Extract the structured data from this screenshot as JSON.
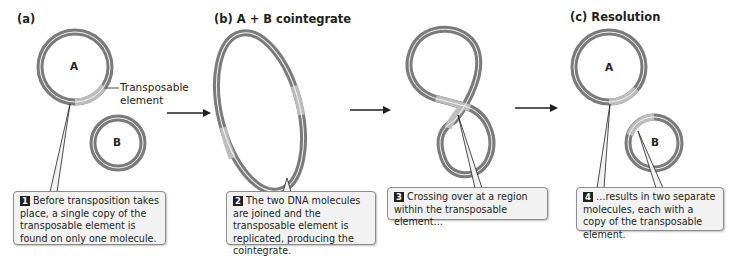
{
  "panels": {
    "a": {
      "label": "(a)"
    },
    "b": {
      "label": "(b)  A + B cointegrate"
    },
    "c": {
      "label": "(c)  Resolution"
    }
  },
  "molecules": {
    "a_A": "A",
    "a_B": "B",
    "c_A": "A",
    "c_B": "B"
  },
  "labels": {
    "transposable_element_line1": "Transposable",
    "transposable_element_line2": "element"
  },
  "steps": [
    {
      "number": "1",
      "text": "Before transposition takes place, a single copy of the transposable element is found on only one molecule."
    },
    {
      "number": "2",
      "text": "The two DNA molecules are joined and the transposable element is replicated, producing the cointegrate."
    },
    {
      "number": "3",
      "text": "Crossing over at a region within the transposable element…"
    },
    {
      "number": "4",
      "text": "…results in two separate molecules, each with a copy of the transposable element."
    }
  ],
  "colors": {
    "dna_dark": "#7b7b7b",
    "transposable_element": "#bdbdbd",
    "inner_line": "#f4f4f4",
    "callout_bg": "#f2f2f2",
    "badge": "#231f20"
  }
}
